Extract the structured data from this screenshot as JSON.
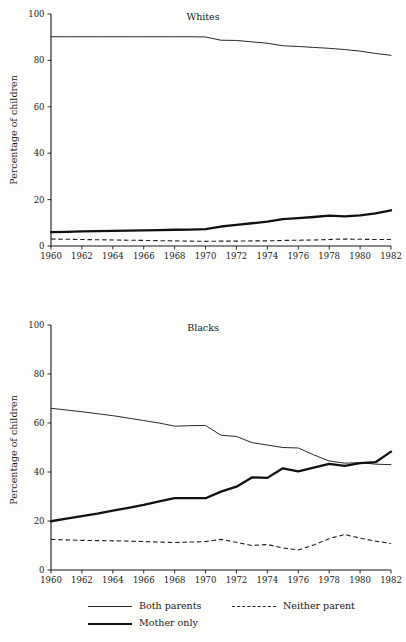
{
  "figure": {
    "axis_title": "Percentage of children",
    "legend": [
      {
        "key": "both",
        "label": "Both parents",
        "style": "thin-solid"
      },
      {
        "key": "mother",
        "label": "Mother only",
        "style": "thick-solid"
      },
      {
        "key": "neither",
        "label": "Neither parent",
        "style": "dashed"
      }
    ]
  },
  "chart_data": [
    {
      "type": "line",
      "title": "Whites",
      "xlabel": "",
      "ylabel": "Percentage of children",
      "xlim": [
        1960,
        1982
      ],
      "ylim": [
        0,
        100
      ],
      "yticks": [
        0,
        20,
        40,
        60,
        80,
        100
      ],
      "xticks": [
        1960,
        1962,
        1964,
        1966,
        1968,
        1970,
        1972,
        1974,
        1976,
        1978,
        1980,
        1982
      ],
      "xtick_labels": [
        "1960",
        "1962",
        "1964",
        "1966",
        "1968",
        "1970",
        "1972",
        "1974",
        "1976",
        "1978",
        "1980",
        "1982"
      ],
      "ytick_labels": [
        "0",
        "20",
        "40",
        "60",
        "80",
        "100"
      ],
      "grid": false,
      "legend_position": "below-figure",
      "x": [
        1960,
        1961,
        1962,
        1963,
        1964,
        1965,
        1966,
        1967,
        1968,
        1969,
        1970,
        1971,
        1972,
        1973,
        1974,
        1975,
        1976,
        1977,
        1978,
        1979,
        1980,
        1981,
        1982
      ],
      "series": [
        {
          "name": "Both parents",
          "values": [
            90.2,
            90.2,
            90.2,
            90.2,
            90.2,
            90.2,
            90.2,
            90.2,
            90.2,
            90.2,
            90.1,
            88.7,
            88.6,
            88.0,
            87.4,
            86.3,
            86.0,
            85.6,
            85.2,
            84.7,
            84.0,
            83.0,
            82.2
          ]
        },
        {
          "name": "Mother only",
          "values": [
            6.0,
            6.1,
            6.3,
            6.4,
            6.5,
            6.6,
            6.7,
            6.8,
            7.0,
            7.1,
            7.3,
            8.4,
            9.1,
            9.8,
            10.5,
            11.6,
            12.0,
            12.5,
            13.1,
            12.8,
            13.2,
            14.1,
            15.4
          ]
        },
        {
          "name": "Neither parent",
          "values": [
            3.0,
            2.9,
            2.8,
            2.7,
            2.6,
            2.5,
            2.4,
            2.3,
            2.2,
            2.1,
            2.0,
            2.1,
            2.1,
            2.2,
            2.2,
            2.4,
            2.5,
            2.6,
            2.8,
            3.0,
            2.9,
            2.8,
            2.8
          ]
        }
      ]
    },
    {
      "type": "line",
      "title": "Blacks",
      "xlabel": "",
      "ylabel": "Percentage of children",
      "xlim": [
        1960,
        1982
      ],
      "ylim": [
        0,
        100
      ],
      "yticks": [
        0,
        20,
        40,
        60,
        80,
        100
      ],
      "xticks": [
        1960,
        1962,
        1964,
        1966,
        1968,
        1970,
        1972,
        1974,
        1976,
        1978,
        1980,
        1982
      ],
      "xtick_labels": [
        "1960",
        "1962",
        "1964",
        "1966",
        "1968",
        "1970",
        "1972",
        "1974",
        "1976",
        "1978",
        "1980",
        "1982"
      ],
      "ytick_labels": [
        "0",
        "20",
        "40",
        "60",
        "80",
        "100"
      ],
      "grid": false,
      "legend_position": "below-figure",
      "x": [
        1960,
        1961,
        1962,
        1963,
        1964,
        1965,
        1966,
        1967,
        1968,
        1969,
        1970,
        1971,
        1972,
        1973,
        1974,
        1975,
        1976,
        1977,
        1978,
        1979,
        1980,
        1981,
        1982
      ],
      "series": [
        {
          "name": "Both parents",
          "values": [
            66.0,
            65.3,
            64.6,
            63.8,
            63.0,
            62.0,
            61.0,
            60.0,
            58.7,
            58.9,
            59.0,
            55.0,
            54.5,
            52.0,
            51.0,
            50.0,
            49.8,
            47.0,
            44.5,
            43.6,
            43.8,
            43.2,
            43.0
          ]
        },
        {
          "name": "Mother only",
          "values": [
            19.9,
            21.0,
            22.0,
            23.0,
            24.2,
            25.4,
            26.6,
            28.0,
            29.3,
            29.3,
            29.3,
            32.0,
            34.0,
            37.8,
            37.6,
            41.5,
            40.3,
            41.8,
            43.3,
            42.5,
            43.6,
            44.0,
            48.3
          ]
        },
        {
          "name": "Neither parent",
          "values": [
            12.5,
            12.3,
            12.1,
            12.0,
            11.9,
            11.8,
            11.6,
            11.4,
            11.2,
            11.4,
            11.6,
            12.5,
            11.3,
            10.0,
            10.4,
            9.0,
            8.2,
            10.2,
            12.8,
            14.5,
            13.0,
            11.8,
            10.8
          ]
        }
      ]
    }
  ]
}
